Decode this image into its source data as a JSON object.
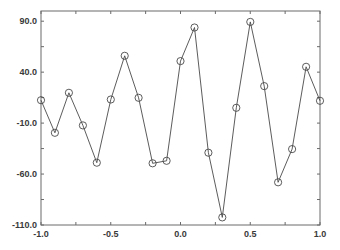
{
  "chart_data": {
    "type": "line",
    "title": "",
    "xlabel": "",
    "ylabel": "",
    "xlim": [
      -1.0,
      1.0
    ],
    "ylim": [
      -110.0,
      100.0
    ],
    "grid": false,
    "legend": null,
    "marker": "open-circle",
    "x_ticks": [
      -1.0,
      -0.5,
      0.0,
      0.5,
      1.0
    ],
    "x_tick_labels": [
      "-1.0",
      "-0.5",
      "0.0",
      "0.5",
      "1.0"
    ],
    "x_minor_ticks": [
      -0.75,
      -0.25,
      0.25,
      0.75
    ],
    "y_ticks": [
      90.0,
      40.0,
      -10.0,
      -60.0,
      -110.0
    ],
    "y_tick_labels": [
      "90.0",
      "40.0",
      "-10.0",
      "-60.0",
      "-110.0"
    ],
    "y_minor_ticks": [
      65.0,
      15.0,
      -35.0,
      -85.0
    ],
    "x": [
      -1.0,
      -0.9,
      -0.8,
      -0.7,
      -0.6,
      -0.5,
      -0.4,
      -0.3,
      -0.2,
      -0.1,
      0.0,
      0.1,
      0.2,
      0.3,
      0.4,
      0.5,
      0.6,
      0.7,
      0.8,
      0.9,
      1.0
    ],
    "series": [
      {
        "name": "series-1",
        "values": [
          12.5,
          -19.5,
          19.7,
          -12.3,
          -48.9,
          13.2,
          56.0,
          14.8,
          -49.5,
          -47.0,
          50.8,
          83.8,
          -39.1,
          -102.5,
          5.0,
          89.3,
          26.3,
          -68.1,
          -35.5,
          45.2,
          11.9
        ]
      }
    ]
  },
  "colors": {
    "line": "#4a4a4a",
    "frame": "#6a6a6a",
    "text": "#3a3a3a",
    "background": "#ffffff"
  }
}
